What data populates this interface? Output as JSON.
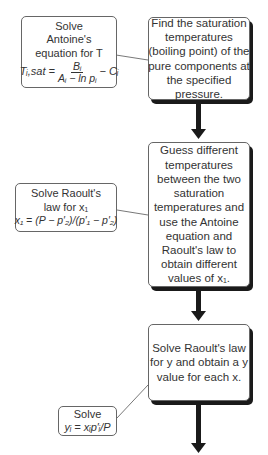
{
  "flowchart": {
    "main_steps": [
      {
        "lines": [
          "Find the saturation",
          "temperatures",
          "(boiling point) of the",
          "pure components at",
          "the specified",
          "pressure."
        ]
      },
      {
        "lines": [
          "Guess different",
          "temperatures",
          "between the two",
          "saturation",
          "temperatures and",
          "use the Antoine",
          "equation and",
          "Raoult's law to",
          "obtain different",
          "values of x₁."
        ]
      },
      {
        "lines": [
          "Solve Raoult's law",
          "for y and obtain a y",
          "value for each x."
        ]
      }
    ],
    "side_notes": [
      {
        "lines": [
          "Solve",
          "Antoine's",
          "equation for T"
        ],
        "equation_lhs": "Tᵢ,sat =",
        "equation_num": "Bᵢ",
        "equation_den": "Aᵢ − ln pᵢ",
        "equation_tail": "− Cᵢ"
      },
      {
        "lines": [
          "Solve Raoult's",
          "law for x₁"
        ],
        "equation": "x₁ = (P − p′₂)/(p′₁ − p′₂)"
      },
      {
        "lines": [
          "Solve"
        ],
        "equation": "yᵢ = xᵢp′ᵢ/P"
      }
    ],
    "colors": {
      "arrow": "#1a1a1a",
      "border": "#666666",
      "shadow": "#1a1a1a",
      "text": "#333333"
    }
  }
}
